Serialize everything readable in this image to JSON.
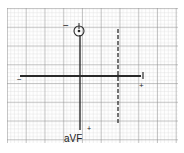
{
  "diagram": {
    "type": "ecg-axis-diagram",
    "leads": {
      "lead_I": {
        "label": "I",
        "positive_label": "+",
        "negative_label": "−"
      },
      "lead_aVF": {
        "label": "aVF",
        "positive_label": "+",
        "negative_label": "−"
      }
    },
    "colors": {
      "grid_minor": "#c8c8c8",
      "grid_major": "#8a8a8a",
      "axis": "#2a2a2a",
      "background": "#ffffff"
    }
  }
}
